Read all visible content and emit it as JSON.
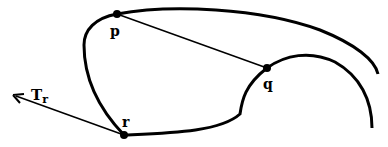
{
  "diagram": {
    "points": [
      {
        "id": "p",
        "label": "p",
        "x": 117,
        "y": 14
      },
      {
        "id": "q",
        "label": "q",
        "x": 267,
        "y": 68
      },
      {
        "id": "r",
        "label": "r",
        "x": 124,
        "y": 135
      }
    ],
    "tangent": {
      "label_main": "T",
      "label_sub": "r"
    },
    "colors": {
      "stroke": "#000000",
      "background": "#ffffff"
    }
  }
}
